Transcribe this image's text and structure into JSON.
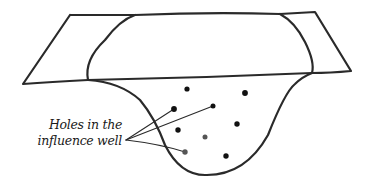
{
  "diagram": {
    "type": "hand-drawn sketch",
    "label": {
      "line1": "Holes in the",
      "line2": "influence well"
    },
    "colors": {
      "ink": "#2a2a2a",
      "dot_dark": "#111111",
      "dot_gray": "#555555",
      "background": "#ffffff"
    },
    "holes": [
      {
        "x": 187,
        "y": 89,
        "r": 2.6,
        "shade": "dark"
      },
      {
        "x": 245,
        "y": 93,
        "r": 2.9,
        "shade": "dark"
      },
      {
        "x": 174,
        "y": 109,
        "r": 2.9,
        "shade": "dark",
        "pointed": true
      },
      {
        "x": 213,
        "y": 106,
        "r": 2.5,
        "shade": "dark",
        "pointed": true
      },
      {
        "x": 178,
        "y": 130,
        "r": 2.7,
        "shade": "dark"
      },
      {
        "x": 237,
        "y": 124,
        "r": 2.7,
        "shade": "dark"
      },
      {
        "x": 205,
        "y": 137,
        "r": 2.5,
        "shade": "gray"
      },
      {
        "x": 185,
        "y": 152,
        "r": 2.7,
        "shade": "gray",
        "pointed": true
      },
      {
        "x": 226,
        "y": 156,
        "r": 2.7,
        "shade": "dark"
      }
    ]
  }
}
